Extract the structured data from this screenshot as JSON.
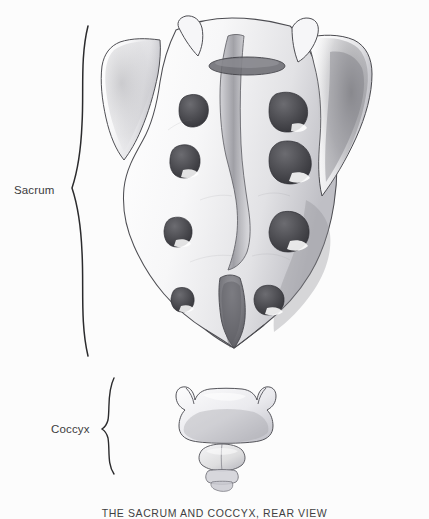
{
  "figure": {
    "caption": "THE SACRUM AND COCCYX, REAR VIEW",
    "background_color": "#fcfcfc",
    "ink_color": "#2b2b2d",
    "labels": [
      {
        "id": "sacrum",
        "text": "Sacrum"
      },
      {
        "id": "coccyx",
        "text": "Coccyx"
      }
    ],
    "braces": [
      {
        "id": "sacrum-brace",
        "spans_label": "Sacrum"
      },
      {
        "id": "coccyx-brace",
        "spans_label": "Coccyx"
      }
    ],
    "anatomy": {
      "subject": "sacrum-and-coccyx",
      "view": "rear",
      "medium": "pencil-drawing",
      "parts": [
        "sacrum",
        "sacral-ala-left",
        "sacral-ala-right",
        "median-sacral-crest",
        "sacral-foramina",
        "sacral-hiatus",
        "coccyx-segment-1",
        "coccyx-cornu-left",
        "coccyx-cornu-right",
        "coccyx-segment-2",
        "coccyx-segment-3",
        "coccyx-segment-4"
      ],
      "foramina_pairs": 4
    }
  }
}
